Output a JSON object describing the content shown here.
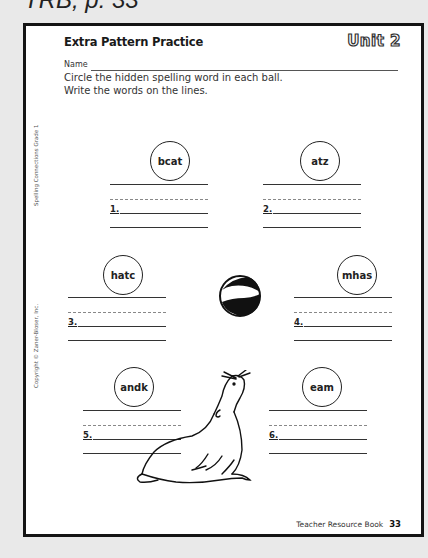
{
  "caption": "TRB, p. 33",
  "worksheet": {
    "title": "Extra Pattern Practice",
    "unit_label": "Unit 2",
    "name_label": "Name",
    "instructions": "Circle the hidden spelling word in each ball. Write the words on the lines.",
    "side_text_top": "Spelling Connections Grade 1",
    "side_text_bottom": "Copyright © Zaner-Bloser, Inc.",
    "items": [
      {
        "number": "1.",
        "ball_text": "bcat"
      },
      {
        "number": "2.",
        "ball_text": "atz"
      },
      {
        "number": "3.",
        "ball_text": "hatc"
      },
      {
        "number": "4.",
        "ball_text": "mhas"
      },
      {
        "number": "5.",
        "ball_text": "andk"
      },
      {
        "number": "6.",
        "ball_text": "eam"
      }
    ],
    "illustrations": [
      "beach-ball",
      "seal"
    ],
    "footer": {
      "book": "Teacher Resource Book",
      "page": "33"
    }
  }
}
